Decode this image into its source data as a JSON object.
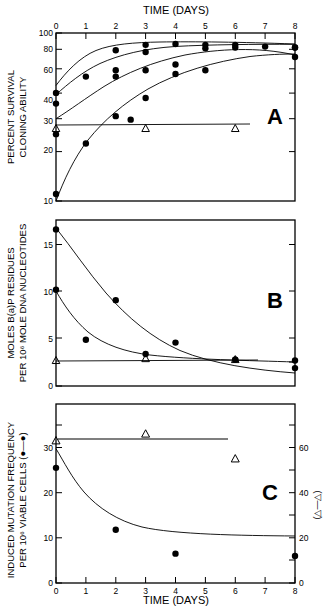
{
  "figure": {
    "title_top": "TIME (DAYS)",
    "title_bottom": "TIME (DAYS)",
    "panel_labels": [
      "A",
      "B",
      "C"
    ],
    "background": "#ffffff",
    "ink": "#000000"
  },
  "panelA": {
    "label": "A",
    "ylabel_line1": "PERCENT SURVIVAL",
    "ylabel_line2": "CLONING ABILITY",
    "yticks": [
      "100",
      "80",
      "60",
      "40",
      "30",
      "20",
      "10"
    ],
    "xticks": [
      "0",
      "1",
      "2",
      "3",
      "4",
      "5",
      "6",
      "7",
      "8"
    ]
  },
  "panelB": {
    "label": "B",
    "ylabel_line1": "MOLES B(a)P RESIDUES",
    "ylabel_line2": "PER 10⁶ MOLE DNA NUCLEOTIDES",
    "yticks": [
      "15",
      "10",
      "5",
      "0"
    ]
  },
  "panelC": {
    "label": "C",
    "ylabel_line1": "INDUCED MUTATION FREQUENCY",
    "ylabel_line2": "PER 10⁶ VIABLE CELLS (●—●)",
    "yticks_left": [
      "30",
      "20",
      "10",
      "0"
    ],
    "yticks_right": [
      "60",
      "40",
      "20",
      "0"
    ],
    "ylabel_right": "(△—△)",
    "xticks": [
      "0",
      "1",
      "2",
      "3",
      "4",
      "5",
      "6",
      "7",
      "8"
    ]
  },
  "chart_data": [
    {
      "type": "scatter",
      "panel": "A",
      "title": "TIME (DAYS)",
      "xlabel": "TIME (DAYS)",
      "ylabel": "PERCENT SURVIVAL CLONING ABILITY",
      "xlim": [
        0,
        8
      ],
      "ylim": [
        10,
        100
      ],
      "yscale": "log",
      "grid": false,
      "xticks": [
        0,
        1,
        2,
        3,
        4,
        5,
        6,
        7,
        8
      ],
      "yticks": [
        10,
        20,
        30,
        40,
        60,
        80,
        100
      ],
      "series": [
        {
          "name": "curve-1-filled-circles",
          "marker": "filled-circle",
          "x": [
            0,
            1,
            2,
            3,
            4,
            5,
            6,
            8
          ],
          "y": [
            44,
            55,
            79,
            85,
            86,
            85,
            85,
            82
          ]
        },
        {
          "name": "curve-2-filled-circles",
          "marker": "filled-circle",
          "x": [
            0,
            2,
            3,
            4,
            5,
            6,
            7,
            8
          ],
          "y": [
            38,
            60,
            77,
            65,
            81,
            82,
            83,
            82
          ]
        },
        {
          "name": "curve-3-filled-circles",
          "marker": "filled-circle",
          "x": [
            0,
            2,
            3,
            4,
            5,
            8
          ],
          "y": [
            25,
            55,
            60,
            57,
            60,
            72
          ]
        },
        {
          "name": "curve-4-filled-circles",
          "marker": "filled-circle",
          "x": [
            0,
            1,
            2,
            2.5,
            3
          ],
          "y": [
            11,
            22,
            32,
            30.5,
            41
          ]
        },
        {
          "name": "control-open-triangles",
          "marker": "open-triangle",
          "x": [
            0,
            3,
            6
          ],
          "y": [
            27,
            27,
            27
          ]
        }
      ]
    },
    {
      "type": "scatter",
      "panel": "B",
      "xlabel": "TIME (DAYS)",
      "ylabel": "MOLES B(a)P RESIDUES PER 10^6 MOLE DNA NUCLEOTIDES",
      "xlim": [
        0,
        8
      ],
      "ylim": [
        0,
        17.5
      ],
      "yscale": "linear",
      "grid": false,
      "yticks": [
        0,
        5,
        10,
        15
      ],
      "series": [
        {
          "name": "upper-decay-filled-circles",
          "marker": "filled-circle",
          "x": [
            0,
            2,
            4,
            6,
            8
          ],
          "y": [
            16.6,
            9.1,
            4.6,
            2.8,
            1.9
          ]
        },
        {
          "name": "lower-decay-filled-circles",
          "marker": "filled-circle",
          "x": [
            0,
            1,
            3,
            6,
            8
          ],
          "y": [
            10.2,
            4.9,
            3.4,
            2.8,
            2.7
          ]
        },
        {
          "name": "control-open-triangles",
          "marker": "open-triangle",
          "x": [
            0,
            3,
            6
          ],
          "y": [
            2.7,
            2.9,
            2.8
          ]
        }
      ]
    },
    {
      "type": "scatter",
      "panel": "C",
      "xlabel": "TIME (DAYS)",
      "ylabel": "INDUCED MUTATION FREQUENCY PER 10^6 VIABLE CELLS",
      "ylabel_right": "(triangle-triangle)",
      "xlim": [
        0,
        8
      ],
      "ylim": [
        0,
        34
      ],
      "ylim_right": [
        0,
        68
      ],
      "yscale": "linear",
      "grid": false,
      "yticks_left": [
        0,
        10,
        20,
        30
      ],
      "yticks_right": [
        0,
        20,
        40,
        60
      ],
      "series": [
        {
          "name": "mutation-frequency-filled-circles",
          "marker": "filled-circle",
          "axis": "left",
          "x": [
            0,
            2,
            4,
            8
          ],
          "y": [
            25.5,
            11.8,
            6.5,
            6.0
          ]
        },
        {
          "name": "control-open-triangles",
          "marker": "open-triangle",
          "axis": "right",
          "x": [
            0,
            3,
            6
          ],
          "y": [
            63,
            66,
            55
          ]
        }
      ]
    }
  ]
}
